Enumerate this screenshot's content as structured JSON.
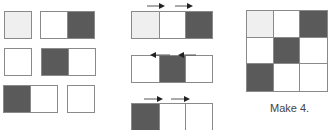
{
  "colors": {
    "light": "#efefef",
    "white": "#ffffff",
    "dark": "#5a5a5a",
    "border": "#8a8a8a",
    "arrow": "#555555"
  },
  "pieces": [
    {
      "id": "p1",
      "x": 4,
      "y": 11,
      "cells": [
        "light"
      ]
    },
    {
      "id": "p2",
      "x": 40,
      "y": 11,
      "cells": [
        "white",
        "dark"
      ]
    },
    {
      "id": "p3",
      "x": 4,
      "y": 48,
      "cells": [
        "white"
      ]
    },
    {
      "id": "p4",
      "x": 41,
      "y": 48,
      "cells": [
        "dark",
        "white"
      ]
    },
    {
      "id": "p5",
      "x": 3,
      "y": 85,
      "cells": [
        "dark",
        "white"
      ]
    },
    {
      "id": "p6",
      "x": 67,
      "y": 85,
      "cells": [
        "white"
      ]
    }
  ],
  "rows": [
    {
      "id": "r1",
      "x": 131,
      "y": 11,
      "cells": [
        "light",
        "white",
        "dark"
      ]
    },
    {
      "id": "r2",
      "x": 131,
      "y": 55,
      "cells": [
        "white",
        "dark",
        "white"
      ]
    },
    {
      "id": "r3",
      "x": 131,
      "y": 103,
      "cells": [
        "dark",
        "white",
        "white"
      ]
    }
  ],
  "arrows": [
    {
      "dir": "right",
      "x": 147,
      "y": -4,
      "w": 18
    },
    {
      "dir": "right",
      "x": 175,
      "y": -4,
      "w": 18
    },
    {
      "dir": "left",
      "x": 150,
      "y": 45,
      "w": 20
    },
    {
      "dir": "left",
      "x": 178,
      "y": 45,
      "w": 18
    },
    {
      "dir": "right",
      "x": 144,
      "y": 89,
      "w": 19
    },
    {
      "dir": "right",
      "x": 171,
      "y": 89,
      "w": 19
    }
  ],
  "grid": {
    "cells": [
      "light",
      "white",
      "dark",
      "white",
      "dark",
      "white",
      "dark",
      "white",
      "white"
    ]
  },
  "caption": "Make 4."
}
